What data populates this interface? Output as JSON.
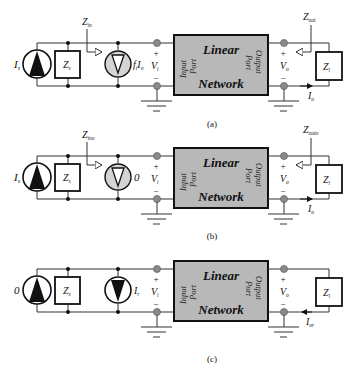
{
  "figure": {
    "panels": [
      {
        "id": "a",
        "caption": "(a)",
        "source": {
          "symbol": "I",
          "subscript": "s"
        },
        "source_impedance": {
          "symbol": "Z",
          "subscript": "s"
        },
        "controlled_source": {
          "label": "f",
          "label_sub": "i",
          "label2": "I",
          "label2_sub": "o",
          "style": "dependent"
        },
        "input_impedance": {
          "symbol": "Z",
          "subscript": "in"
        },
        "input_voltage": {
          "plus": "+",
          "symbol": "V",
          "subscript": "i",
          "minus": "−"
        },
        "network": {
          "line1": "Linear",
          "line2": "Network",
          "input_port": [
            "Input",
            "Port"
          ],
          "output_port": [
            "Output",
            "Port"
          ]
        },
        "output_voltage": {
          "plus": "+",
          "symbol": "V",
          "subscript": "o",
          "minus": "−"
        },
        "output_impedance": {
          "symbol": "Z",
          "subscript": "out"
        },
        "load": {
          "symbol": "Z",
          "subscript": "l"
        },
        "output_current": {
          "symbol": "I",
          "subscript": "o"
        }
      },
      {
        "id": "b",
        "caption": "(b)",
        "source": {
          "symbol": "I",
          "subscript": "s"
        },
        "source_impedance": {
          "symbol": "Z",
          "subscript": "s"
        },
        "controlled_source": {
          "label": "0",
          "style": "dependent"
        },
        "input_impedance": {
          "symbol": "Z",
          "subscript": "ino"
        },
        "input_voltage": {
          "plus": "+",
          "symbol": "V",
          "subscript": "i",
          "minus": "−"
        },
        "network": {
          "line1": "Linear",
          "line2": "Network",
          "input_port": [
            "Input",
            "Port"
          ],
          "output_port": [
            "Output",
            "Port"
          ]
        },
        "output_voltage": {
          "plus": "+",
          "symbol": "V",
          "subscript": "o",
          "minus": "−"
        },
        "output_impedance": {
          "symbol": "Z",
          "subscript": "outo"
        },
        "load": {
          "symbol": "Z",
          "subscript": "l"
        },
        "output_current": {
          "symbol": "I",
          "subscript": "o"
        }
      },
      {
        "id": "c",
        "caption": "(c)",
        "source": {
          "symbol": "0",
          "subscript": ""
        },
        "source_impedance": {
          "symbol": "Z",
          "subscript": "s"
        },
        "controlled_source": {
          "label": "I",
          "label_sub": "r",
          "style": "independent"
        },
        "input_voltage": {
          "plus": "+",
          "symbol": "V",
          "subscript": "i",
          "minus": "−"
        },
        "network": {
          "line1": "Linear",
          "line2": "Network",
          "input_port": [
            "Input",
            "Port"
          ],
          "output_port": [
            "Output",
            "Port"
          ]
        },
        "output_voltage": {
          "plus": "+",
          "symbol": "V",
          "subscript": "o",
          "minus": "−"
        },
        "load": {
          "symbol": "Z",
          "subscript": "l"
        },
        "output_current": {
          "symbol": "I",
          "subscript": "or"
        }
      }
    ],
    "colors": {
      "network_fill": "#b8b8b8",
      "dependent_source_fill": "#d4d4d4",
      "node_fill": "#8a8a8a",
      "wire": "#333333"
    }
  }
}
